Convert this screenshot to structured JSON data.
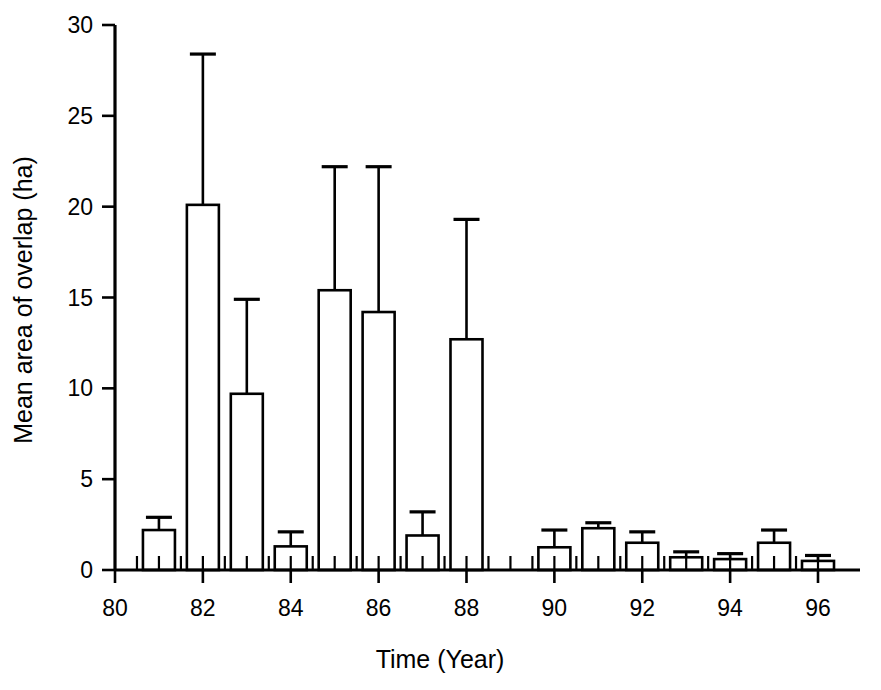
{
  "chart_data": {
    "type": "bar",
    "title": "",
    "xlabel": "Time (Year)",
    "ylabel": "Mean area of overlap (ha)",
    "grid": false,
    "legend": "none",
    "error_bars": "upper only (standard error)",
    "xlim": [
      80,
      97
    ],
    "ylim": [
      0,
      30
    ],
    "xticks": [
      80,
      82,
      84,
      86,
      88,
      90,
      92,
      94,
      96
    ],
    "xtick_labels": [
      "80",
      "82",
      "84",
      "86",
      "88",
      "90",
      "92",
      "94",
      "96"
    ],
    "xminor_ticks": [
      81,
      83,
      85,
      87,
      89,
      91,
      93,
      95
    ],
    "yticks": [
      0,
      5,
      10,
      15,
      20,
      25,
      30
    ],
    "ytick_labels": [
      "0",
      "5",
      "10",
      "15",
      "20",
      "25",
      "30"
    ],
    "categories": [
      81,
      82,
      83,
      84,
      85,
      86,
      87,
      88,
      90,
      91,
      92,
      93,
      94,
      95,
      96
    ],
    "values": [
      2.2,
      20.1,
      9.7,
      1.3,
      15.4,
      14.2,
      1.9,
      12.7,
      1.25,
      2.3,
      1.5,
      0.7,
      0.6,
      1.5,
      0.5
    ],
    "error_upper": [
      2.9,
      28.4,
      14.9,
      2.1,
      22.2,
      22.2,
      3.2,
      19.3,
      2.2,
      2.6,
      2.1,
      1.0,
      0.9,
      2.2,
      0.8
    ],
    "bars": [
      {
        "year": 81,
        "value": 2.2,
        "error_top": 2.9
      },
      {
        "year": 82,
        "value": 20.1,
        "error_top": 28.4
      },
      {
        "year": 83,
        "value": 9.7,
        "error_top": 14.9
      },
      {
        "year": 84,
        "value": 1.3,
        "error_top": 2.1
      },
      {
        "year": 85,
        "value": 15.4,
        "error_top": 22.2
      },
      {
        "year": 86,
        "value": 14.2,
        "error_top": 22.2
      },
      {
        "year": 87,
        "value": 1.9,
        "error_top": 3.2
      },
      {
        "year": 88,
        "value": 12.7,
        "error_top": 19.3
      },
      {
        "year": 90,
        "value": 1.25,
        "error_top": 2.2
      },
      {
        "year": 91,
        "value": 2.3,
        "error_top": 2.6
      },
      {
        "year": 92,
        "value": 1.5,
        "error_top": 2.1
      },
      {
        "year": 93,
        "value": 0.7,
        "error_top": 1.0
      },
      {
        "year": 94,
        "value": 0.6,
        "error_top": 0.9
      },
      {
        "year": 95,
        "value": 1.5,
        "error_top": 2.2
      },
      {
        "year": 96,
        "value": 0.5,
        "error_top": 0.8
      }
    ],
    "colors": {
      "bar_fill": "#ffffff",
      "bar_stroke": "#000000",
      "axis": "#000000",
      "text": "#000000",
      "background": "#ffffff"
    }
  }
}
